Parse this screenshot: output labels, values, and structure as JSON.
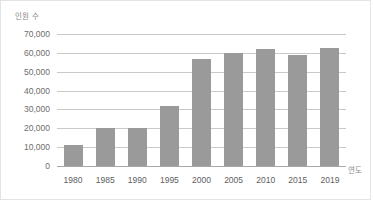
{
  "chart_data": {
    "type": "bar",
    "title": "",
    "subtitle": "",
    "xlabel": "연도",
    "ylabel": "인원 수",
    "categories": [
      "1980",
      "1985",
      "1990",
      "1995",
      "2000",
      "2005",
      "2010",
      "2015",
      "2019"
    ],
    "values": [
      11000,
      20000,
      20000,
      32000,
      57000,
      60000,
      62000,
      59000,
      62500
    ],
    "ylim": [
      0,
      70000
    ],
    "y_ticks": [
      0,
      10000,
      20000,
      30000,
      40000,
      50000,
      60000,
      70000
    ],
    "y_tick_labels": [
      "0",
      "10,000",
      "20,000",
      "30,000",
      "40,000",
      "50,000",
      "60,000",
      "70,000"
    ],
    "grid": true,
    "legend": null,
    "bar_color": "#9a9a9a",
    "gridline_color": "#c9c9c9",
    "axis_color": "#a8a8a8",
    "background_color": "#ffffff",
    "border_color": "#e3e3e3",
    "tick_label_color": "#6d6d6d",
    "axis_title_color": "#8a8a8a"
  }
}
